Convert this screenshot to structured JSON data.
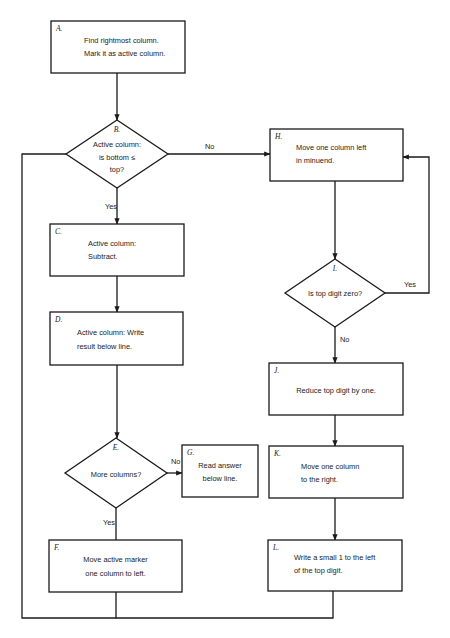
{
  "diagram": {
    "type": "flowchart",
    "nodes": [
      {
        "id": "A",
        "label": "A.",
        "shape": "process",
        "lines": [
          "Find rightmost column.",
          "Mark it as active column."
        ]
      },
      {
        "id": "B",
        "label": "B.",
        "shape": "decision",
        "lines": [
          "Active column:",
          "is bottom ≤",
          "top?"
        ]
      },
      {
        "id": "C",
        "label": "C.",
        "shape": "process",
        "lines": [
          "Active column:",
          "Subtract."
        ]
      },
      {
        "id": "D",
        "label": "D.",
        "shape": "process",
        "lines": [
          "Active column: Write",
          "result below line."
        ]
      },
      {
        "id": "E",
        "label": "E.",
        "shape": "decision",
        "lines": [
          "More columns?"
        ]
      },
      {
        "id": "F",
        "label": "F.",
        "shape": "process",
        "lines": [
          "Move active marker",
          "one column to left."
        ]
      },
      {
        "id": "G",
        "label": "G.",
        "shape": "process",
        "lines": [
          "Read answer",
          "below line."
        ]
      },
      {
        "id": "H",
        "label": "H.",
        "shape": "process",
        "lines": [
          "Move one column left",
          "in minuend."
        ]
      },
      {
        "id": "I",
        "label": "I.",
        "shape": "decision",
        "lines": [
          "Is top digit zero?"
        ]
      },
      {
        "id": "J",
        "label": "J.",
        "shape": "process",
        "lines": [
          "Reduce top digit by one."
        ]
      },
      {
        "id": "K",
        "label": "K.",
        "shape": "process",
        "lines": [
          "Move one column",
          "to the right."
        ]
      },
      {
        "id": "L",
        "label": "L.",
        "shape": "process",
        "lines": [
          "Write a small 1 to the left",
          "of the top digit."
        ]
      }
    ],
    "edges": [
      {
        "from": "A",
        "to": "B",
        "label": ""
      },
      {
        "from": "B",
        "to": "C",
        "label": "Yes"
      },
      {
        "from": "B",
        "to": "H",
        "label": "No"
      },
      {
        "from": "C",
        "to": "D",
        "label": ""
      },
      {
        "from": "D",
        "to": "E",
        "label": ""
      },
      {
        "from": "E",
        "to": "G",
        "label": "No"
      },
      {
        "from": "E",
        "to": "F",
        "label": "Yes"
      },
      {
        "from": "F",
        "to": "B",
        "label": ""
      },
      {
        "from": "H",
        "to": "I",
        "label": ""
      },
      {
        "from": "I",
        "to": "H",
        "label": "Yes"
      },
      {
        "from": "I",
        "to": "J",
        "label": "No"
      },
      {
        "from": "J",
        "to": "K",
        "label": ""
      },
      {
        "from": "K",
        "to": "L",
        "label": ""
      },
      {
        "from": "L",
        "to": "B",
        "label": ""
      }
    ]
  }
}
